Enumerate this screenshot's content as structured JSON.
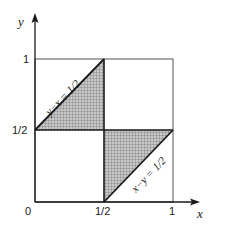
{
  "diagram": {
    "type": "unit-square-region",
    "axes": {
      "x_label": "x",
      "y_label": "y",
      "origin_label": "0"
    },
    "ticks": {
      "x": [
        "1/2",
        "1"
      ],
      "y": [
        "1/2",
        "1"
      ]
    },
    "lines": [
      {
        "equation": "y−x = 1/2",
        "from": [
          0,
          0.5
        ],
        "to": [
          0.5,
          1
        ]
      },
      {
        "equation": "x−y = 1/2",
        "from": [
          0.5,
          0
        ],
        "to": [
          1,
          0.5
        ]
      }
    ],
    "shaded_regions": [
      {
        "name": "upper-left-triangle",
        "vertices": [
          [
            0,
            0.5
          ],
          [
            0.5,
            1
          ],
          [
            0.5,
            0.5
          ]
        ]
      },
      {
        "name": "lower-right-triangle",
        "vertices": [
          [
            0.5,
            0
          ],
          [
            1,
            0.5
          ],
          [
            0.5,
            0.5
          ]
        ]
      }
    ],
    "colors": {
      "ink": "#1a1a1a",
      "shade": "#a8a8a8",
      "background": "#ffffff"
    }
  }
}
